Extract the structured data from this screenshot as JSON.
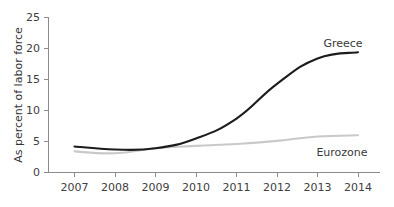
{
  "chart_data": {
    "type": "line",
    "title": "",
    "subtitle": "",
    "xlabel": "",
    "ylabel": "As percent of labor force",
    "categories": [
      "2007",
      "2008",
      "2009",
      "2010",
      "2011",
      "2012",
      "2013",
      "2014"
    ],
    "x": [
      2007,
      2008,
      2009,
      2010,
      2011,
      2012,
      2013,
      2014
    ],
    "xlim": [
      2007,
      2014
    ],
    "ylim": [
      0,
      25
    ],
    "yticks": [
      "0",
      "5",
      "10",
      "15",
      "20",
      "25"
    ],
    "ytick_values": [
      0,
      5,
      10,
      15,
      20,
      25
    ],
    "grid": false,
    "legend_position": "inline-end-of-line",
    "series": [
      {
        "name": "Greece",
        "color": "#1c1c1c",
        "label_x": 2013.65,
        "label_y": 20.7,
        "values": [
          4.2,
          3.7,
          3.9,
          5.5,
          8.7,
          14.3,
          18.4,
          19.4
        ]
      },
      {
        "name": "Eurozone",
        "color": "#c9c9c9",
        "label_x": 2013.6,
        "label_y": 3.2,
        "values": [
          3.4,
          3.1,
          3.9,
          4.3,
          4.6,
          5.1,
          5.8,
          6.0
        ]
      }
    ]
  },
  "axes": {
    "y_axis_title": "As percent of labor force",
    "y_tick_labels": [
      "25",
      "20",
      "15",
      "10",
      "5",
      "0"
    ],
    "x_tick_labels": [
      "2007",
      "2008",
      "2009",
      "2010",
      "2011",
      "2012",
      "2013",
      "2014"
    ]
  },
  "labels": {
    "greece": "Greece",
    "eurozone": "Eurozone"
  },
  "colors": {
    "background": "#ffffff",
    "axis": "#8c8c8c",
    "greece_line": "#1c1c1c",
    "eurozone_line": "#c9c9c9",
    "text": "#3a3a3a"
  }
}
